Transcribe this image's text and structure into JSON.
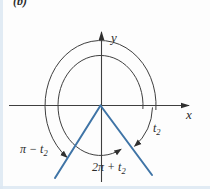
{
  "figure": {
    "part_label": "(b)"
  },
  "axes": {
    "x_label": "x",
    "y_label": "y"
  },
  "angle_labels": {
    "t2": {
      "main": "t",
      "sub": "2"
    },
    "pi_minus_t2": {
      "main": "π − t",
      "sub": "2"
    },
    "two_pi_plus_t2": {
      "main": "2π + t",
      "sub": "2"
    }
  },
  "colors": {
    "terminal_ray": "#3f74a6",
    "diagram_line": "#3f3f3f",
    "part_label_color": "#9c3038"
  }
}
